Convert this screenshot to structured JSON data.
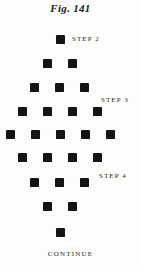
{
  "figure": {
    "title": "Fig. 141",
    "continue_label": "CONTINUE"
  },
  "steps": [
    {
      "label": "STEP 2"
    },
    {
      "label": "STEP 3"
    },
    {
      "label": "STEP 4"
    }
  ],
  "colors": {
    "bead": "#141414",
    "text": "#2a2a2a",
    "title": "#1b1b1b",
    "background": "#fdfdfc"
  },
  "chart_data": {
    "type": "scatter",
    "title": "Fig. 141",
    "xlabel": "",
    "ylabel": "",
    "rows": [
      {
        "row": 1,
        "count": 1,
        "y": 35,
        "x": [
          56
        ]
      },
      {
        "row": 2,
        "count": 2,
        "y": 59,
        "x": [
          43,
          68
        ]
      },
      {
        "row": 3,
        "count": 3,
        "y": 83,
        "x": [
          30,
          55,
          80
        ]
      },
      {
        "row": 4,
        "count": 4,
        "y": 107,
        "x": [
          18,
          43,
          68,
          93
        ]
      },
      {
        "row": 5,
        "count": 5,
        "y": 130,
        "x": [
          6,
          31,
          56,
          81,
          106
        ]
      },
      {
        "row": 6,
        "count": 4,
        "y": 153,
        "x": [
          18,
          43,
          68,
          93
        ]
      },
      {
        "row": 7,
        "count": 3,
        "y": 178,
        "x": [
          30,
          55,
          80
        ]
      },
      {
        "row": 8,
        "count": 2,
        "y": 202,
        "x": [
          43,
          68
        ]
      },
      {
        "row": 9,
        "count": 1,
        "y": 228,
        "x": [
          56
        ]
      }
    ],
    "total_beads": 25,
    "grid": false,
    "legend": false
  }
}
